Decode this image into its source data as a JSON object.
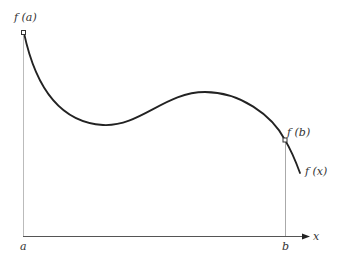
{
  "diagram": {
    "labels": {
      "fa": "f (a)",
      "fb": "f (b)",
      "fx": "f (x)",
      "a": "a",
      "b": "b",
      "x": "x"
    },
    "colors": {
      "curve": "#222222",
      "guide": "#aaaaaa",
      "axis": "#444444",
      "text": "#333333"
    },
    "curve_points": [
      [
        24,
        33
      ],
      [
        103,
        125
      ],
      [
        205,
        92
      ],
      [
        285,
        140
      ],
      [
        300,
        173
      ]
    ]
  }
}
